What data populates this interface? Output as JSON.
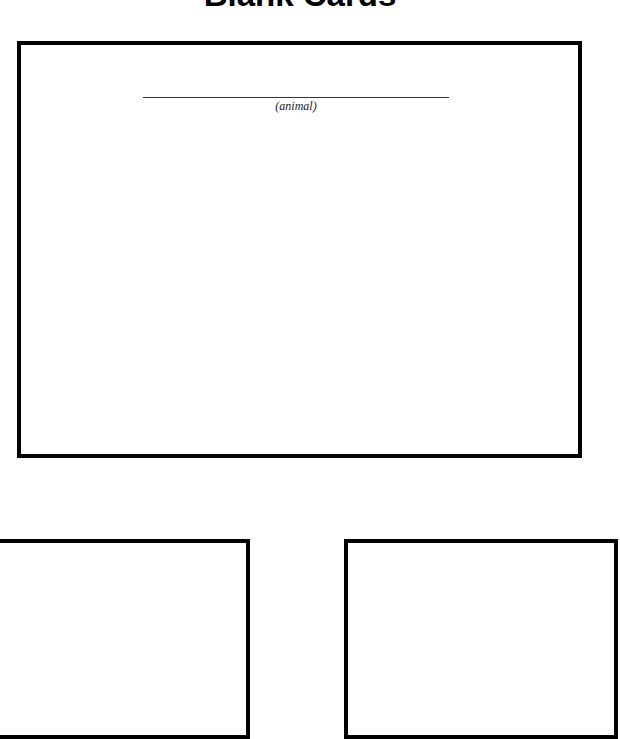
{
  "page": {
    "title": "Blank Cards"
  },
  "cards": [
    {
      "id": "main",
      "fields": [
        {
          "caption": "(animal)",
          "value": ""
        }
      ]
    },
    {
      "id": "bottom-left"
    },
    {
      "id": "bottom-right"
    }
  ],
  "colors": {
    "border": "#000000",
    "background": "#ffffff"
  }
}
